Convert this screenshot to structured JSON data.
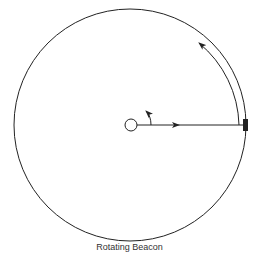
{
  "diagram": {
    "title": "Rotating Beacon",
    "elements": {
      "outer_circle": {
        "label": "orbit-path",
        "cx": 130,
        "cy": 125,
        "r": 116
      },
      "beacon_center": {
        "label": "beacon",
        "cx": 131,
        "cy": 125,
        "r": 6
      },
      "beam_line": {
        "label": "light-beam",
        "x1": 137,
        "y1": 125,
        "x2": 245,
        "y2": 125
      },
      "target_marker": {
        "label": "target",
        "x": 243,
        "y": 119,
        "w": 5,
        "h": 12
      },
      "sweep_arc": {
        "label": "beam-sweep-direction"
      },
      "rotation_arrow": {
        "label": "beacon-rotation-direction"
      }
    },
    "colors": {
      "stroke": "#222222",
      "background": "#ffffff",
      "caption": "#333333"
    }
  }
}
